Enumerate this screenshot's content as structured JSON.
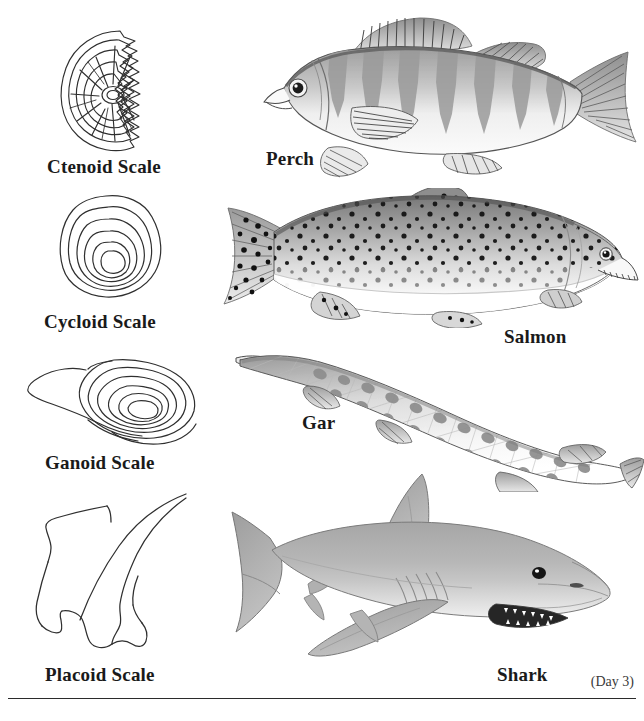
{
  "page": {
    "background_color": "#ffffff",
    "ink_color": "#1a1a1a",
    "top_clipped_line": "",
    "day_note": "(Day 3)",
    "footer_clipped_line": ""
  },
  "scales": [
    {
      "id": "ctenoid",
      "label": "Ctenoid Scale",
      "icon": "ctenoid-scale-diagram",
      "description": "Concentric growth rings with radial lines and a comb-toothed posterior margin"
    },
    {
      "id": "cycloid",
      "label": "Cycloid Scale",
      "icon": "cycloid-scale-diagram",
      "description": "Nested smooth concentric growth rings with a rounded margin"
    },
    {
      "id": "ganoid",
      "label": "Ganoid Scale",
      "icon": "ganoid-scale-diagram",
      "description": "Rhomboid diamond plate with nested rings and an anterior peg"
    },
    {
      "id": "placoid",
      "label": "Placoid Scale",
      "icon": "placoid-scale-diagram",
      "description": "Tooth-like dermal denticle with a curved spine and a basal plate"
    }
  ],
  "fish": [
    {
      "id": "perch",
      "label": "Perch",
      "icon": "perch-illustration",
      "scale_type": "ctenoid",
      "description": "Grayscale perch facing left with dark vertical bars and a spiny dorsal fin"
    },
    {
      "id": "salmon",
      "label": "Salmon",
      "icon": "salmon-illustration",
      "scale_type": "cycloid",
      "description": "Grayscale salmon facing right, heavily black-spotted with a pale belly"
    },
    {
      "id": "gar",
      "label": "Gar",
      "icon": "gar-illustration",
      "scale_type": "ganoid",
      "description": "Elongated gar with a long narrow snout and dark blotches along the body"
    },
    {
      "id": "shark",
      "label": "Shark",
      "icon": "shark-illustration",
      "scale_type": "placoid",
      "description": "Gray shark facing right with a tall dorsal fin, gill slits and toothed jaw"
    }
  ]
}
